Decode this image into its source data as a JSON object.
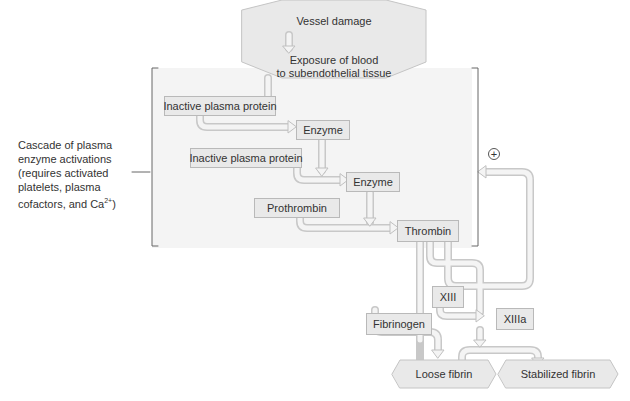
{
  "top": {
    "line1": "Vessel damage",
    "line2": "Exposure of blood",
    "line3": "to subendothelial tissue"
  },
  "side_label": {
    "l1": "Cascade of plasma",
    "l2": "enzyme activations",
    "l3": "(requires activated",
    "l4": "platelets, plasma",
    "l5": "cofactors, and Ca",
    "sup": "2+",
    "l5_end": ")"
  },
  "nodes": {
    "inactive1": "Inactive plasma protein",
    "enzyme1": "Enzyme",
    "inactive2": "Inactive plasma protein",
    "enzyme2": "Enzyme",
    "prothrombin": "Prothrombin",
    "thrombin": "Thrombin",
    "xiii": "XIII",
    "xiiia": "XIIIa",
    "fibrinogen": "Fibrinogen",
    "loose_fibrin": "Loose fibrin",
    "stabilized_fibrin": "Stabilized fibrin"
  },
  "feedback": {
    "symbol": "+"
  },
  "colors": {
    "box_fill": "#e9e9e9",
    "box_border": "#b9b9b9",
    "arrow_fill": "#efefef",
    "region_bg": "#f4f4f4"
  }
}
